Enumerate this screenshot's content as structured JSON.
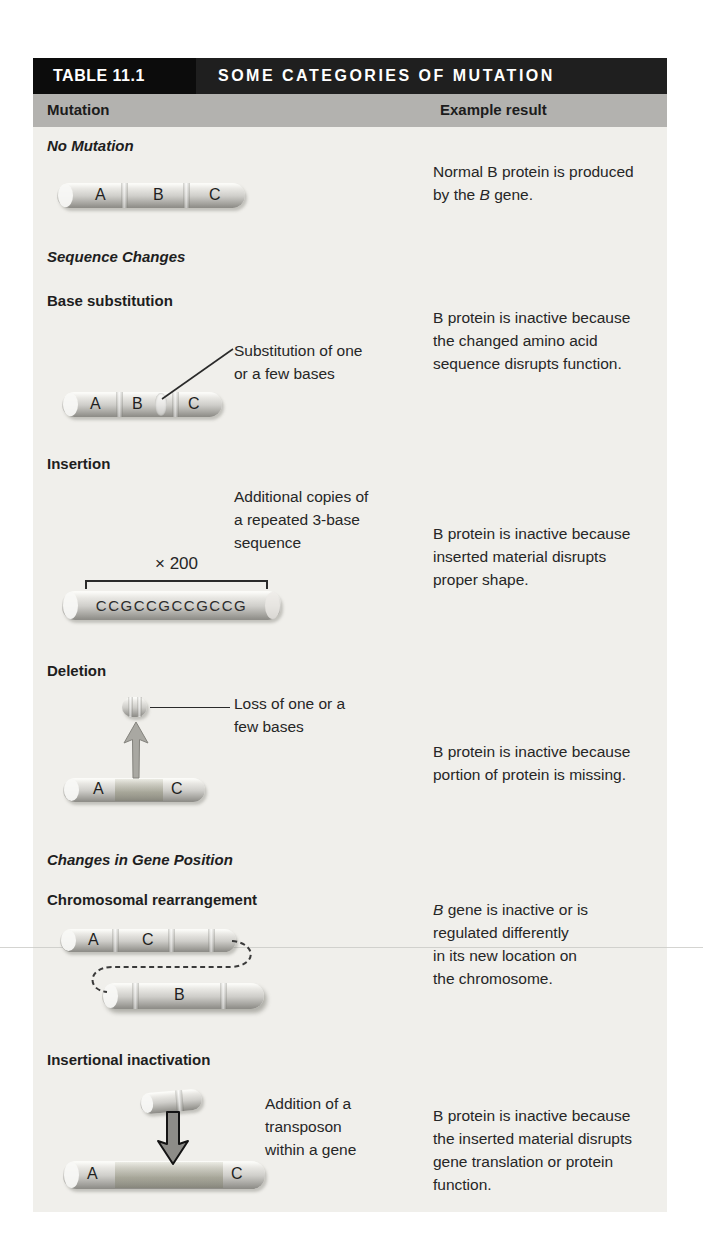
{
  "header": {
    "tag": "TABLE 11.1",
    "title": "SOME CATEGORIES OF MUTATION",
    "col_mutation": "Mutation",
    "col_result": "Example result"
  },
  "colors": {
    "tag_bg": "#0c0c0c",
    "title_bg": "#1f1f1f",
    "column_bar_bg": "#b3b2af",
    "body_bg": "#f0efeb",
    "text": "#262626"
  },
  "sections": {
    "no_mutation": {
      "heading": "No Mutation",
      "seg_a": "A",
      "seg_b": "B",
      "seg_c": "C",
      "result_1": "Normal B protein is produced",
      "result_2_pre": "by the ",
      "result_2_it": "B",
      "result_2_post": " gene."
    },
    "sequence_changes": {
      "heading": "Sequence Changes"
    },
    "base_substitution": {
      "heading": "Base substitution",
      "label_1": "Substitution of one",
      "label_2": "or a few bases",
      "seg_a": "A",
      "seg_b": "B",
      "seg_c": "C",
      "result_1": "B protein is inactive because",
      "result_2": "the changed amino acid",
      "result_3": "sequence disrupts function."
    },
    "insertion": {
      "heading": "Insertion",
      "label_1": "Additional copies of",
      "label_2": "a repeated 3-base",
      "label_3": "sequence",
      "multiplier": "× 200",
      "sequence": "CCGCCGCCGCCG",
      "result_1": "B protein is inactive because",
      "result_2": "inserted material disrupts",
      "result_3": "proper shape."
    },
    "deletion": {
      "heading": "Deletion",
      "label_1": "Loss of one or a",
      "label_2": "few bases",
      "seg_a": "A",
      "seg_c": "C",
      "result_1": "B protein is inactive because",
      "result_2": "portion of protein is missing."
    },
    "gene_position": {
      "heading": "Changes in Gene Position"
    },
    "rearrangement": {
      "heading": "Chromosomal rearrangement",
      "seg_a": "A",
      "seg_c": "C",
      "seg_b": "B",
      "result_1_it": "B",
      "result_1_post": " gene is inactive or is",
      "result_2": "regulated differently",
      "result_3": "in its new location on",
      "result_4": "the chromosome."
    },
    "insertional": {
      "heading": "Insertional inactivation",
      "label_1": "Addition of a",
      "label_2": "transposon",
      "label_3": "within a gene",
      "seg_a": "A",
      "seg_c": "C",
      "result_1": "B protein is inactive because",
      "result_2": "the inserted material disrupts",
      "result_3": "gene translation or protein",
      "result_4": "function."
    }
  }
}
